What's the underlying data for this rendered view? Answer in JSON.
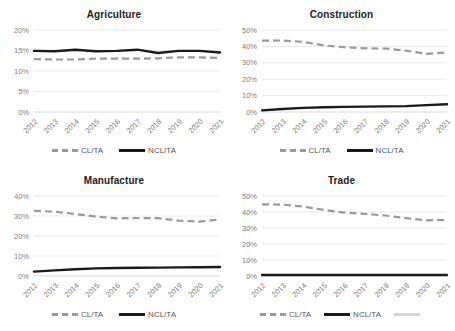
{
  "figure": {
    "panel_order": [
      "agriculture",
      "construction",
      "manufacture",
      "trade"
    ]
  },
  "legend": {
    "cl_label": "CL/TA",
    "ncl_label": "NCL/TA",
    "extra_label": ""
  },
  "colors": {
    "cl_line": "#9a9a9a",
    "ncl_line": "#1a1a1a",
    "extra_line": "#d6d6d6",
    "gridline": "#e3e3e3",
    "tick_text": "#808080",
    "title_text": "#222222"
  },
  "chart_data": [
    {
      "id": "agriculture",
      "type": "line",
      "title": "Agriculture",
      "xlabel": "",
      "ylabel": "",
      "x": [
        "2012",
        "2013",
        "2014",
        "2015",
        "2016",
        "2017",
        "2018",
        "2019",
        "2020",
        "2021"
      ],
      "ylim": [
        0,
        20
      ],
      "yticks": [
        0,
        5,
        10,
        15,
        20
      ],
      "yticklabels": [
        "0%",
        "5%",
        "10%",
        "15%",
        "20%"
      ],
      "grid": true,
      "legend_position": "bottom",
      "series": [
        {
          "name": "CL/TA",
          "style": "dashed",
          "values": [
            12.9,
            12.8,
            12.8,
            13.0,
            13.0,
            13.0,
            13.1,
            13.3,
            13.3,
            13.2
          ]
        },
        {
          "name": "NCL/TA",
          "style": "solid",
          "values": [
            14.9,
            14.8,
            15.2,
            14.8,
            14.9,
            15.2,
            14.4,
            14.9,
            14.9,
            14.5
          ]
        }
      ]
    },
    {
      "id": "construction",
      "type": "line",
      "title": "Construction",
      "xlabel": "",
      "ylabel": "",
      "x": [
        "2012",
        "2013",
        "2014",
        "2015",
        "2016",
        "2017",
        "2018",
        "2019",
        "2020",
        "2021"
      ],
      "ylim": [
        0,
        50
      ],
      "yticks": [
        0,
        10,
        20,
        30,
        40,
        50
      ],
      "yticklabels": [
        "0%",
        "10%",
        "20%",
        "30%",
        "40%",
        "50%"
      ],
      "grid": true,
      "legend_position": "bottom",
      "series": [
        {
          "name": "CL/TA",
          "style": "dashed",
          "values": [
            43.5,
            43.6,
            42.8,
            40.6,
            39.5,
            38.8,
            38.7,
            37.4,
            35.5,
            36.3
          ]
        },
        {
          "name": "NCL/TA",
          "style": "solid",
          "values": [
            1.0,
            1.8,
            2.5,
            2.9,
            3.1,
            3.3,
            3.4,
            3.6,
            4.2,
            4.7
          ]
        }
      ]
    },
    {
      "id": "manufacture",
      "type": "line",
      "title": "Manufacture",
      "xlabel": "",
      "ylabel": "",
      "x": [
        "2012",
        "2013",
        "2014",
        "2015",
        "2016",
        "2017",
        "2018",
        "2019",
        "2020",
        "2021"
      ],
      "ylim": [
        0,
        40
      ],
      "yticks": [
        0,
        10,
        20,
        30,
        40
      ],
      "yticklabels": [
        "0%",
        "10%",
        "20%",
        "30%",
        "40%"
      ],
      "grid": true,
      "legend_position": "bottom",
      "series": [
        {
          "name": "CL/TA",
          "style": "dashed",
          "values": [
            32.6,
            32.2,
            31.0,
            29.7,
            28.8,
            29.0,
            28.9,
            27.7,
            27.2,
            28.3
          ]
        },
        {
          "name": "NCL/TA",
          "style": "solid",
          "values": [
            2.2,
            2.8,
            3.4,
            3.8,
            4.0,
            4.1,
            4.2,
            4.3,
            4.4,
            4.5
          ]
        }
      ]
    },
    {
      "id": "trade",
      "type": "line",
      "title": "Trade",
      "xlabel": "",
      "ylabel": "",
      "x": [
        "2012",
        "2013",
        "2014",
        "2015",
        "2016",
        "2017",
        "2018",
        "2019",
        "2020",
        "2021"
      ],
      "ylim": [
        0,
        50
      ],
      "yticks": [
        0,
        10,
        20,
        30,
        40,
        50
      ],
      "yticklabels": [
        "0%",
        "10%",
        "20%",
        "30%",
        "40%",
        "50%"
      ],
      "grid": true,
      "legend_position": "bottom",
      "series": [
        {
          "name": "CL/TA",
          "style": "dashed",
          "values": [
            44.8,
            44.6,
            43.4,
            41.3,
            39.6,
            38.8,
            37.8,
            36.2,
            34.8,
            35.0
          ]
        },
        {
          "name": "NCL/TA",
          "style": "solid",
          "values": [
            0.6,
            0.6,
            0.6,
            0.6,
            0.6,
            0.6,
            0.6,
            0.6,
            0.6,
            0.6
          ]
        }
      ]
    }
  ]
}
